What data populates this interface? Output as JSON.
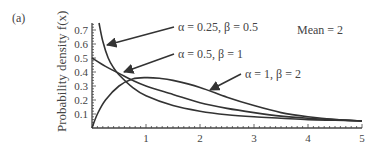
{
  "panel_label": "(a)",
  "annotation_mean": "Mean = 2",
  "chart_data": {
    "type": "line",
    "title": "",
    "panel": "(a)",
    "xlabel": "",
    "ylabel": "Probability density f(x)",
    "xlim": [
      0,
      5
    ],
    "ylim": [
      0,
      0.75
    ],
    "x_ticks": [
      "1",
      "2",
      "3",
      "4",
      "5"
    ],
    "y_ticks": [
      "0.1",
      "0.2",
      "0.3",
      "0.4",
      "0.5",
      "0.6",
      "0.7"
    ],
    "grid": false,
    "annotations": [
      "Mean = 2"
    ],
    "series": [
      {
        "name": "α = 0.25, β = 0.5",
        "x": [
          0.13,
          0.2,
          0.3,
          0.4,
          0.5,
          0.75,
          1.0,
          1.5,
          2.0,
          2.5,
          3.0,
          3.5,
          4.0,
          4.5,
          5.0
        ],
        "y": [
          0.75,
          0.62,
          0.5,
          0.43,
          0.38,
          0.29,
          0.23,
          0.16,
          0.12,
          0.095,
          0.08,
          0.07,
          0.06,
          0.055,
          0.05
        ]
      },
      {
        "name": "α = 0.5, β = 1",
        "x": [
          0,
          0.25,
          0.5,
          0.75,
          1.0,
          1.5,
          2.0,
          2.5,
          3.0,
          3.5,
          4.0,
          4.5,
          5.0
        ],
        "y": [
          0.5,
          0.44,
          0.39,
          0.34,
          0.3,
          0.24,
          0.18,
          0.14,
          0.11,
          0.085,
          0.07,
          0.06,
          0.05
        ]
      },
      {
        "name": "α = 1, β = 2",
        "x": [
          0,
          0.1,
          0.25,
          0.5,
          0.75,
          1.0,
          1.25,
          1.5,
          2.0,
          2.5,
          3.0,
          3.5,
          4.0,
          4.5,
          5.0
        ],
        "y": [
          0,
          0.1,
          0.2,
          0.3,
          0.35,
          0.36,
          0.355,
          0.34,
          0.29,
          0.22,
          0.16,
          0.11,
          0.08,
          0.06,
          0.05
        ]
      }
    ],
    "labels": [
      {
        "text": "α = 0.25, β = 0.5",
        "x": 178,
        "y": 31,
        "arrow_to": [
          107,
          45
        ]
      },
      {
        "text": "α = 0.5, β = 1",
        "x": 178,
        "y": 58,
        "arrow_to": [
          124,
          72
        ]
      },
      {
        "text": "α = 1, β = 2",
        "x": 245,
        "y": 78,
        "arrow_to": [
          210,
          90
        ]
      }
    ]
  }
}
